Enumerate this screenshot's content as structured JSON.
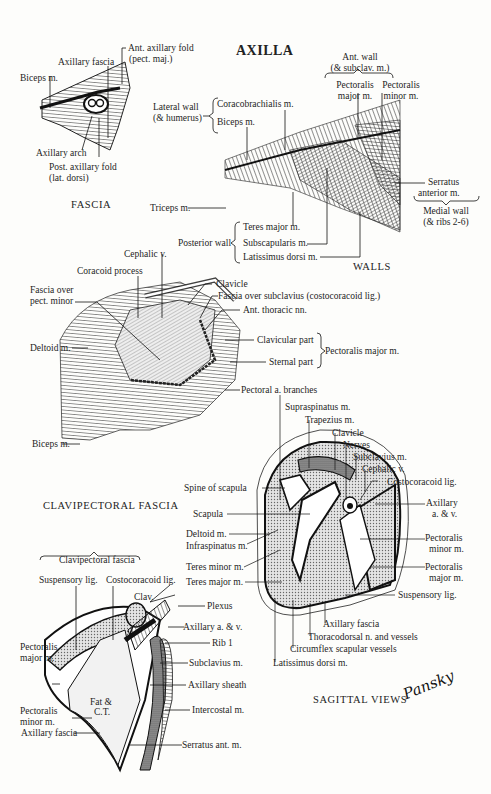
{
  "title": "AXILLA",
  "panels": {
    "fascia": {
      "caption": "FASCIA",
      "labels": {
        "biceps": "Biceps m.",
        "axillary_fascia": "Axillary fascia",
        "ant_fold_1": "Ant. axillary fold",
        "ant_fold_2": "(pect. maj.)",
        "axillary_arch": "Axillary arch",
        "post_fold_1": "Post. axillary fold",
        "post_fold_2": "(lat. dorsi)"
      }
    },
    "walls": {
      "caption": "WALLS",
      "labels": {
        "ant_wall_1": "Ant. wall",
        "ant_wall_2": "(& subclav. m.)",
        "pec_major_1": "Pectoralis",
        "pec_major_2": "major m.",
        "pec_minor_1": "Pectoralis",
        "pec_minor_2": "minor m.",
        "lateral_wall_1": "Lateral wall",
        "lateral_wall_2": "(& humerus)",
        "coracobrachialis": "Coracobrachialis m.",
        "biceps": "Biceps m.",
        "triceps": "Triceps m.",
        "serratus_1": "Serratus",
        "serratus_2": "anterior m.",
        "medial_wall_1": "Medial wall",
        "medial_wall_2": "(& ribs 2-6)",
        "posterior_wall": "Posterior wall",
        "teres_major": "Teres major m.",
        "subscapularis": "Subscapularis m.",
        "latissimus": "Latissimus dorsi m."
      }
    },
    "clavipectoral": {
      "caption": "CLAVIPECTORAL FASCIA",
      "labels": {
        "cephalic": "Cephalic v.",
        "coracoid": "Coracoid process",
        "fascia_pm_1": "Fascia over",
        "fascia_pm_2": "pect. minor",
        "deltoid": "Deltoid m.",
        "biceps": "Biceps m.",
        "clavicle": "Clavicle",
        "fascia_subclavius": "Fascia over subclavius (costocoracoid lig.)",
        "ant_thoracic": "Ant. thoracic nn.",
        "clavicular_part": "Clavicular part",
        "sternal_part": "Sternal part",
        "pec_major": "Pectoralis major m.",
        "pectoral_branches": "Pectoral a. branches"
      }
    },
    "sagittal": {
      "caption": "SAGITTAL VIEWS",
      "labels": {
        "supraspinatus": "Supraspinatus m.",
        "trapezius": "Trapezius m.",
        "clavicle": "Clavicle",
        "nerves": "Nerves",
        "subclavius": "Subclavius m.",
        "cephalic": "Cephalic v.",
        "costocoracoid": "Costocoracoid lig.",
        "axillary_av_1": "Axillary",
        "axillary_av_2": "a. & v.",
        "spine_scapula": "Spine of scapula",
        "scapula": "Scapula",
        "deltoid": "Deltoid m.",
        "infraspinatus": "Infraspinatus m.",
        "teres_minor": "Teres minor m.",
        "teres_major": "Teres major m.",
        "pec_minor_1": "Pectoralis",
        "pec_minor_2": "minor m.",
        "pec_major_1": "Pectoralis",
        "pec_major_2": "major m.",
        "suspensory": "Suspensory lig.",
        "axillary_fascia": "Axillary fascia",
        "thoracodorsal": "Thoracodorsal n. and vessels",
        "circumflex": "Circumflex scapular vessels",
        "latissimus": "Latissimus dorsi m."
      }
    },
    "sagittal_lower": {
      "labels": {
        "clavipectoral_fascia": "Clavipectoral fascia",
        "suspensory": "Suspensory lig.",
        "costocoracoid": "Costocoracoid lig.",
        "clav": "Clav.",
        "plexus": "Plexus",
        "axillary_av": "Axillary a. & v.",
        "rib1": "Rib 1",
        "subclavius": "Subclavius m.",
        "pec_major_1": "Pectoralis",
        "pec_major_2": "major m.",
        "fat_1": "Fat &",
        "fat_2": "C.T.",
        "axillary_sheath": "Axillary sheath",
        "pec_minor_1": "Pectoralis",
        "pec_minor_2": "minor m.",
        "intercostal": "Intercostal m.",
        "axillary_fascia": "Axillary fascia",
        "serratus": "Serratus ant. m."
      }
    }
  },
  "signature": "Pansky",
  "colors": {
    "ink": "#1e1e1e",
    "paper": "#fdfdfb",
    "stipple": "#bdbdbd"
  }
}
